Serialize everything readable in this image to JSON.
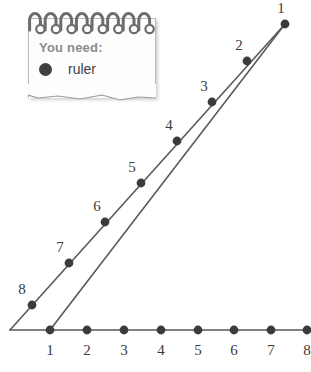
{
  "canvas": {
    "width": 311,
    "height": 372,
    "background": "#ffffff"
  },
  "notepad": {
    "heading": "You need:",
    "items": [
      {
        "bullet_icon": "filled-circle-bullet",
        "label": "ruler"
      }
    ],
    "rings_count": 8,
    "paper_color": "#fdfdfd",
    "heading_color": "#8c8c8c",
    "item_color": "#3f3f3f"
  },
  "chart_data": {
    "type": "scatter",
    "title": "",
    "xlabel": "",
    "ylabel": "",
    "grid": false,
    "legend": false,
    "line_color": "#5a5a5a",
    "dot_color": "#3b3b3b",
    "label_color": "#3b3b3b",
    "series": [
      {
        "name": "baseline",
        "kind": "horizontal-axis",
        "origin": {
          "x": 10,
          "y": 330
        },
        "end": {
          "x": 311,
          "y": 330
        },
        "points": [
          {
            "label": "1",
            "x": 50,
            "y": 330,
            "label_x": 50,
            "label_y": 355
          },
          {
            "label": "2",
            "x": 87,
            "y": 330,
            "label_x": 87,
            "label_y": 355
          },
          {
            "label": "3",
            "x": 124,
            "y": 330,
            "label_x": 124,
            "label_y": 355
          },
          {
            "label": "4",
            "x": 161,
            "y": 330,
            "label_x": 161,
            "label_y": 355
          },
          {
            "label": "5",
            "x": 198,
            "y": 330,
            "label_x": 198,
            "label_y": 355
          },
          {
            "label": "6",
            "x": 234,
            "y": 330,
            "label_x": 234,
            "label_y": 355
          },
          {
            "label": "7",
            "x": 271,
            "y": 330,
            "label_x": 271,
            "label_y": 355
          },
          {
            "label": "8",
            "x": 307,
            "y": 330,
            "label_x": 307,
            "label_y": 355
          }
        ]
      },
      {
        "name": "upper-ray",
        "kind": "ray",
        "origin": {
          "x": 10,
          "y": 330
        },
        "end": {
          "x": 285,
          "y": 24
        },
        "points": [
          {
            "label": "1",
            "x": 285,
            "y": 24,
            "label_x": 281,
            "label_y": 13
          },
          {
            "label": "2",
            "x": 247,
            "y": 61,
            "label_x": 239,
            "label_y": 50
          },
          {
            "label": "3",
            "x": 212,
            "y": 102,
            "label_x": 204,
            "label_y": 91
          },
          {
            "label": "4",
            "x": 177,
            "y": 141,
            "label_x": 169,
            "label_y": 130
          },
          {
            "label": "5",
            "x": 141,
            "y": 183,
            "label_x": 132,
            "label_y": 172
          },
          {
            "label": "6",
            "x": 105,
            "y": 222,
            "label_x": 97,
            "label_y": 211
          },
          {
            "label": "7",
            "x": 69,
            "y": 263,
            "label_x": 60,
            "label_y": 252
          },
          {
            "label": "8",
            "x": 32,
            "y": 305,
            "label_x": 22,
            "label_y": 294
          }
        ]
      },
      {
        "name": "lower-ray",
        "kind": "ray",
        "origin": {
          "x": 50,
          "y": 330
        },
        "end": {
          "x": 285,
          "y": 24
        },
        "points": []
      }
    ]
  }
}
